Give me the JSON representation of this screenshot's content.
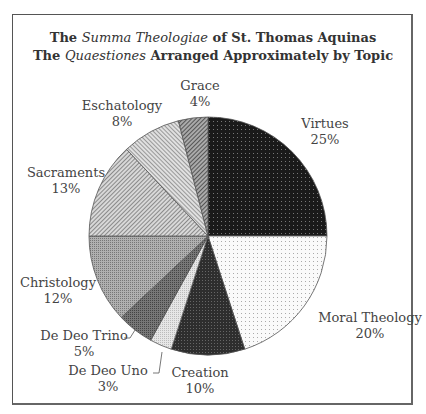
{
  "chart_data": {
    "type": "pie",
    "title": "The Summa Theologiae of St. Thomas Aquinas",
    "subtitle": "The Quaestiones Arranged Approximately by Topic",
    "title_parts": {
      "line1": {
        "pre": "The ",
        "italic": "Summa Theologiae",
        "post": " of St. Thomas Aquinas"
      },
      "line2": {
        "pre": "The ",
        "italic": "Quaestiones",
        "post": " Arranged Approximately by Topic"
      }
    },
    "start_angle_deg": 0,
    "direction": "clockwise",
    "slices": [
      {
        "label": "Virtues",
        "value": 25,
        "pct": "25%",
        "fill": "#222222",
        "pattern": "dark-dots"
      },
      {
        "label": "Moral Theology",
        "value": 20,
        "pct": "20%",
        "fill": "#f4f4f4",
        "pattern": "light-dots"
      },
      {
        "label": "Creation",
        "value": 10,
        "pct": "10%",
        "fill": "#333333",
        "pattern": "dark-grid"
      },
      {
        "label": "De Deo Uno",
        "value": 3,
        "pct": "3%",
        "fill": "#dddddd",
        "pattern": "light-fine"
      },
      {
        "label": "De Deo Trino",
        "value": 5,
        "pct": "5%",
        "fill": "#666666",
        "pattern": "mid-dark-dots"
      },
      {
        "label": "Christology",
        "value": 12,
        "pct": "12%",
        "fill": "#999999",
        "pattern": "mid-grid"
      },
      {
        "label": "Sacraments",
        "value": 13,
        "pct": "13%",
        "fill": "#bbbbbb",
        "pattern": "diagonal-fine"
      },
      {
        "label": "Eschatology",
        "value": 8,
        "pct": "8%",
        "fill": "#cccccc",
        "pattern": "diagonal-light"
      },
      {
        "label": "Grace",
        "value": 4,
        "pct": "4%",
        "fill": "#888888",
        "pattern": "diagonal-dark"
      }
    ],
    "legend": "none (labels placed around pie)"
  },
  "labels": {
    "virtues": {
      "name": "Virtues",
      "pct": "25%"
    },
    "moral": {
      "name": "Moral Theology",
      "pct": "20%"
    },
    "creation": {
      "name": "Creation",
      "pct": "10%"
    },
    "deouno": {
      "name": "De Deo Uno",
      "pct": "3%"
    },
    "deotrino": {
      "name": "De Deo Trino",
      "pct": "5%"
    },
    "christology": {
      "name": "Christology",
      "pct": "12%"
    },
    "sacraments": {
      "name": "Sacraments",
      "pct": "13%"
    },
    "eschatology": {
      "name": "Eschatology",
      "pct": "8%"
    },
    "grace": {
      "name": "Grace",
      "pct": "4%"
    }
  }
}
